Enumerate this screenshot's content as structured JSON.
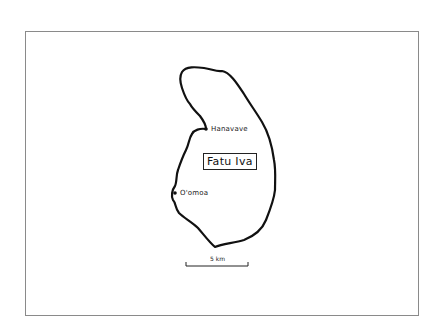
{
  "map": {
    "island_name": "Fatu Iva",
    "places": [
      {
        "name": "Hanavave",
        "x": 206,
        "y": 129
      },
      {
        "name": "O'omoa",
        "x": 175,
        "y": 193
      }
    ],
    "scale_bar": {
      "label": "5 km"
    },
    "colors": {
      "coastline": "#111111",
      "frame": "#8a8a8a",
      "background": "#ffffff"
    }
  }
}
